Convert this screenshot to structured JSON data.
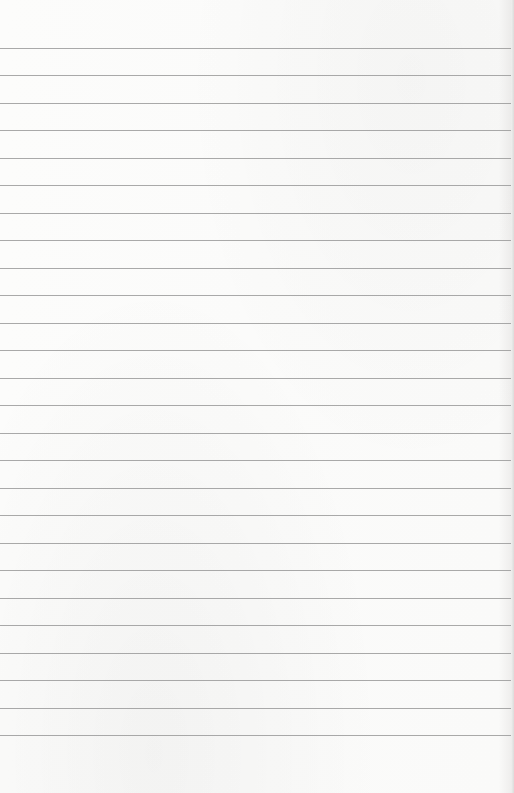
{
  "page": {
    "type": "lined-paper",
    "background_color": "#fbfbfa",
    "rule_color": "#9a9a9a",
    "rule_count": 26,
    "first_rule_y": 47.5,
    "rule_spacing": 27.5,
    "text": ""
  }
}
